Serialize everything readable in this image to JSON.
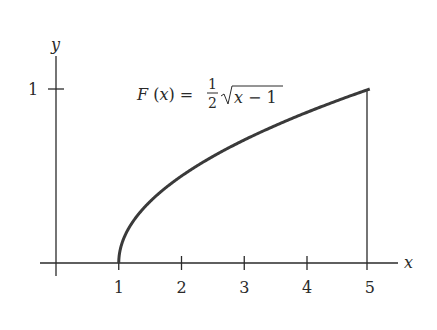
{
  "chart_data": {
    "type": "line",
    "title": "",
    "annotation": {
      "lhs": "F (x) =",
      "frac_num": "1",
      "frac_den": "2",
      "radicand": "x − 1"
    },
    "function": "F(x) = (1/2)·sqrt(x − 1)",
    "xlabel": "x",
    "ylabel": "y",
    "x_ticks": [
      "1",
      "2",
      "3",
      "4",
      "5"
    ],
    "y_ticks": [
      "1"
    ],
    "xlim": [
      0,
      5.5
    ],
    "ylim": [
      0,
      1.1
    ],
    "grid": false,
    "legend": "none",
    "series": [
      {
        "name": "F(x)",
        "x": [
          1,
          1.05,
          1.1,
          1.25,
          1.5,
          2,
          2.5,
          3,
          3.5,
          4,
          4.5,
          5
        ],
        "y": [
          0,
          0.112,
          0.158,
          0.25,
          0.354,
          0.5,
          0.612,
          0.707,
          0.791,
          0.866,
          0.935,
          1.0
        ]
      }
    ],
    "vertical_line_at_x": 5,
    "color": "#3a3a3a"
  }
}
